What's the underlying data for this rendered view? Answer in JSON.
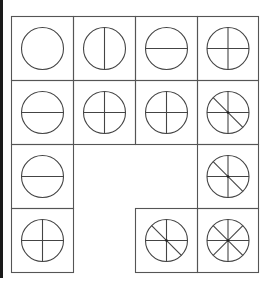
{
  "puzzle": {
    "colors": {
      "line": "#444444",
      "border": "#555555",
      "background": "#ffffff"
    },
    "columns": [
      11,
      73,
      135,
      197,
      258
    ],
    "rows": [
      16,
      80,
      144,
      208,
      272
    ],
    "cells": [
      {
        "row": 0,
        "col": 0,
        "lines": []
      },
      {
        "row": 0,
        "col": 1,
        "lines": [
          "v"
        ]
      },
      {
        "row": 0,
        "col": 2,
        "lines": [
          "h"
        ]
      },
      {
        "row": 0,
        "col": 3,
        "lines": [
          "h",
          "v"
        ]
      },
      {
        "row": 1,
        "col": 0,
        "lines": [
          "h"
        ]
      },
      {
        "row": 1,
        "col": 1,
        "lines": [
          "h",
          "v"
        ]
      },
      {
        "row": 1,
        "col": 2,
        "lines": [
          "h",
          "v"
        ]
      },
      {
        "row": 1,
        "col": 3,
        "lines": [
          "h",
          "v",
          "d1"
        ]
      },
      {
        "row": 2,
        "col": 0,
        "lines": [
          "h"
        ]
      },
      {
        "row": 2,
        "col": 3,
        "lines": [
          "h",
          "v",
          "d1"
        ]
      },
      {
        "row": 3,
        "col": 0,
        "lines": [
          "h",
          "v"
        ]
      },
      {
        "row": 3,
        "col": 2,
        "lines": [
          "h",
          "v",
          "d1"
        ]
      },
      {
        "row": 3,
        "col": 3,
        "lines": [
          "h",
          "v",
          "d1",
          "d2"
        ]
      }
    ]
  }
}
